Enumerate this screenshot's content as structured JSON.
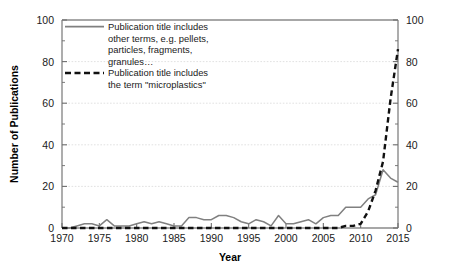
{
  "chart_data": {
    "type": "line",
    "title": "",
    "xlabel": "Year",
    "ylabel": "Number of Publications",
    "xlim": [
      1970,
      2015
    ],
    "ylim": [
      0,
      100
    ],
    "y2lim": [
      0,
      100
    ],
    "grid": true,
    "grid_values": [
      20,
      40,
      60,
      80
    ],
    "legend_position": "top-left-inside",
    "xticks": [
      1970,
      1975,
      1980,
      1985,
      1990,
      1995,
      2000,
      2005,
      2010,
      2015
    ],
    "xtick_labels": [
      "1970",
      "1975",
      "1980",
      "1985",
      "1990",
      "1995",
      "2000",
      "2005",
      "2010",
      "2015"
    ],
    "yticks": [
      0,
      20,
      40,
      60,
      80,
      100
    ],
    "ytick_labels": [
      "0",
      "20",
      "40",
      "60",
      "80",
      "100"
    ],
    "y2ticks": [
      0,
      20,
      40,
      60,
      80,
      100
    ],
    "y2tick_labels": [
      "0",
      "20",
      "40",
      "60",
      "80",
      "100"
    ],
    "yminor_ticks": [
      10,
      30,
      50,
      70,
      90
    ],
    "x": [
      1970,
      1971,
      1972,
      1973,
      1974,
      1975,
      1976,
      1977,
      1978,
      1979,
      1980,
      1981,
      1982,
      1983,
      1984,
      1985,
      1986,
      1987,
      1988,
      1989,
      1990,
      1991,
      1992,
      1993,
      1994,
      1995,
      1996,
      1997,
      1998,
      1999,
      2000,
      2001,
      2002,
      2003,
      2004,
      2005,
      2006,
      2007,
      2008,
      2009,
      2010,
      2011,
      2012,
      2013,
      2014,
      2015
    ],
    "series": [
      {
        "name": "Publication title includes other terms, e.g. pellets, particles, fragments, granules…",
        "style": "solid",
        "color": "#808080",
        "values": [
          0,
          0,
          1,
          2,
          2,
          1,
          4,
          1,
          1,
          1,
          2,
          3,
          2,
          3,
          2,
          1,
          1,
          5,
          5,
          4,
          4,
          6,
          6,
          5,
          3,
          2,
          4,
          3,
          1,
          6,
          2,
          2,
          3,
          4,
          2,
          5,
          6,
          6,
          10,
          10,
          10,
          14,
          16,
          28,
          24,
          22
        ]
      },
      {
        "name": "Publication title includes the term \"microplastics\"",
        "style": "dashed",
        "color": "#111111",
        "values": [
          0,
          0,
          0,
          0,
          0,
          0,
          0,
          0,
          0,
          0,
          0,
          0,
          0,
          0,
          0,
          0,
          0,
          0,
          0,
          0,
          0,
          0,
          0,
          0,
          0,
          0,
          0,
          0,
          0,
          0,
          0,
          0,
          0,
          0,
          0,
          0,
          0,
          0,
          1,
          1,
          2,
          8,
          18,
          32,
          62,
          86
        ]
      }
    ],
    "legend_entries": [
      {
        "style": "solid",
        "color": "#808080",
        "lines": [
          "Publication title includes",
          "other terms, e.g. pellets,",
          "particles, fragments,",
          "granules…"
        ]
      },
      {
        "style": "dashed",
        "color": "#111111",
        "lines": [
          "Publication title includes",
          "the term \"microplastics\""
        ]
      }
    ]
  }
}
